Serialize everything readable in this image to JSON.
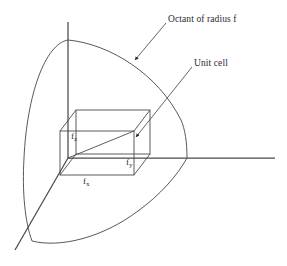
{
  "figure": {
    "background_color": "#ffffff",
    "line_color": "#3a3a3a",
    "text_color": "#2b2b2b"
  },
  "callouts": [
    {
      "name": "octant-callout",
      "text": "Octant of radius f",
      "leader_from": [
        166,
        22
      ],
      "leader_to": [
        133,
        62
      ]
    },
    {
      "name": "unit-cell-callout",
      "text": "Unit cell",
      "leader_from": [
        192,
        66
      ],
      "leader_to": [
        134,
        139
      ]
    }
  ],
  "labels": {
    "octant": "Octant of radius f",
    "unit_cell": "Unit cell",
    "fz_base": "f",
    "fz_sub": "z",
    "fy_base": "f",
    "fy_sub": "y",
    "fx_base": "f",
    "fx_sub": "x"
  },
  "axes": {
    "origin": [
      68,
      158
    ],
    "z_axis": {
      "name": "z-axis",
      "from": [
        68,
        22
      ],
      "to": [
        68,
        158
      ]
    },
    "y_axis": {
      "name": "y-axis",
      "from": [
        68,
        158
      ],
      "to": [
        275,
        158
      ]
    },
    "x_axis": {
      "name": "x-axis",
      "from": [
        68,
        158
      ],
      "to": [
        15,
        250
      ]
    }
  },
  "octant": {
    "radius_label": "f",
    "arc_top_left": {
      "from": [
        68,
        40
      ],
      "to": [
        25,
        205
      ]
    },
    "arc_top_right": {
      "from": [
        68,
        40
      ],
      "to": [
        187,
        158
      ]
    },
    "arc_bottom": {
      "from": [
        30,
        240
      ],
      "to": [
        187,
        158
      ]
    },
    "arc_left_lower": {
      "from": [
        25,
        205
      ],
      "to": [
        30,
        240
      ]
    }
  },
  "unit_cell": {
    "front_face": {
      "x": 60,
      "y": 131,
      "width": 74,
      "height": 44
    },
    "back_face": {
      "x": 76,
      "y": 110,
      "width": 74,
      "height": 44
    },
    "dimensions": [
      "f_x",
      "f_y",
      "f_z"
    ]
  }
}
